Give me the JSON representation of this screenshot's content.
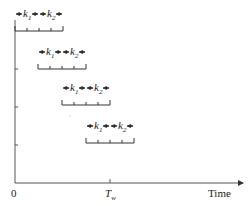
{
  "axes": {
    "x_label": "Time",
    "origin_label": "0",
    "tw_label_main": "T",
    "tw_label_sub": "w"
  },
  "windows": [
    {
      "x_start": 15,
      "y": 31,
      "label_y": 17
    },
    {
      "x_start": 38,
      "y": 69,
      "label_y": 55
    },
    {
      "x_start": 62,
      "y": 105,
      "label_y": 91
    },
    {
      "x_start": 86,
      "y": 143,
      "label_y": 129
    }
  ],
  "segment_labels": {
    "k1_main": "k",
    "k1_sub": "1",
    "k2_main": "k",
    "k2_sub": "2"
  },
  "colors": {
    "line": "#333333",
    "axis": "#555555",
    "text": "#222222"
  }
}
